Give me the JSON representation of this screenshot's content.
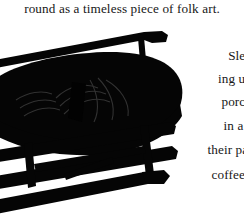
{
  "page": {
    "background_color": "#ffffff",
    "text_color": "#171717",
    "ink_color": "#000000"
  },
  "top_text": {
    "line": "round as a timeless piece of folk art."
  },
  "body_text": {
    "note": "right-hand text column, each line clipped by the right edge of the crop",
    "lines": [
      "Sled",
      "ing up",
      "porch",
      "in a s",
      "their pai",
      "coffee t"
    ]
  },
  "photo": {
    "subject": "vintage wooden sled with metal runners, silhouetted in black on white",
    "tone": "black-and-white photograph",
    "parts": [
      "deck",
      "decorative carved panel",
      "upper rail",
      "cross braces",
      "runners"
    ]
  }
}
